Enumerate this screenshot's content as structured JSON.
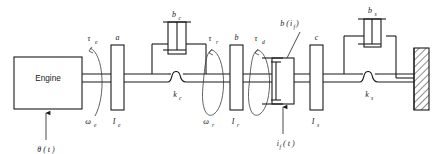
{
  "diagram": {
    "type": "mechanical-schematic",
    "engine_block": {
      "label": "Engine",
      "x": 14,
      "y": 57,
      "w": 68,
      "h": 52
    },
    "input_signal": {
      "label": "θ ( t )",
      "arrow_from_y": 142,
      "arrow_to_y": 111,
      "x": 46
    },
    "clutch_current_signal": {
      "label": "i",
      "label_sub": "f",
      "label_tail": "( t )",
      "full": "if( t )",
      "x": 283,
      "arrow_from_y": 136,
      "arrow_to_y": 104
    },
    "inertias": [
      {
        "name": "I_e",
        "base": "I",
        "sub": "e",
        "top_label": "a",
        "x": 111,
        "y": 45,
        "w": 13,
        "h": 65
      },
      {
        "name": "I_r",
        "base": "I",
        "sub": "r",
        "top_label": "b",
        "x": 230,
        "y": 45,
        "w": 13,
        "h": 65
      },
      {
        "name": "I_s",
        "base": "I",
        "sub": "s",
        "top_label": "c",
        "x": 310,
        "y": 45,
        "w": 13,
        "h": 65
      }
    ],
    "torques": [
      {
        "label": "τ",
        "sub": "e",
        "x": 92,
        "y": 38
      },
      {
        "label": "τ",
        "sub": "r",
        "x": 213,
        "y": 38
      },
      {
        "label": "τ",
        "sub": "d",
        "x": 259,
        "y": 38
      }
    ],
    "speeds": [
      {
        "label": "ω",
        "sub": "e",
        "x": 88,
        "y": 118
      },
      {
        "label": "ω",
        "sub": "r",
        "x": 207,
        "y": 118
      }
    ],
    "dampers": [
      {
        "name": "b_c",
        "base": "b",
        "sub": "c",
        "label_x": 177,
        "label_y": 20,
        "body_x": 170,
        "body_y": 28
      },
      {
        "name": "b_s",
        "base": "b",
        "sub": "s",
        "label_x": 377,
        "label_y": 16,
        "body_x": 368,
        "body_y": 24
      }
    ],
    "springs": [
      {
        "name": "k_c",
        "base": "k",
        "sub": "c",
        "label_x": 178,
        "label_y": 101,
        "coil_x": 172,
        "coil_y": 78
      },
      {
        "name": "k_s",
        "base": "k",
        "sub": "s",
        "label_x": 370,
        "label_y": 101,
        "coil_x": 364,
        "coil_y": 78
      }
    ],
    "clutch": {
      "name": "b(i_f)",
      "label_prefix": "b (",
      "label_var": "i",
      "label_sub": "f",
      "label_suffix": " )",
      "label_x": 292,
      "label_y": 24,
      "body_x": 272,
      "body_y": 58,
      "body_w": 22,
      "body_h": 46
    },
    "wall": {
      "name": "ground-wall",
      "x": 414,
      "y": 48,
      "w": 16,
      "h": 62,
      "hatched": true
    },
    "shaft": {
      "y_top": 74,
      "y_bottom": 82,
      "x_start": 82,
      "x_end": 414
    },
    "colors": {
      "line": "#1a1a1a",
      "thin_line": "#2a2a2a",
      "arc": "#3a3a3a",
      "background": "#ffffff"
    }
  }
}
